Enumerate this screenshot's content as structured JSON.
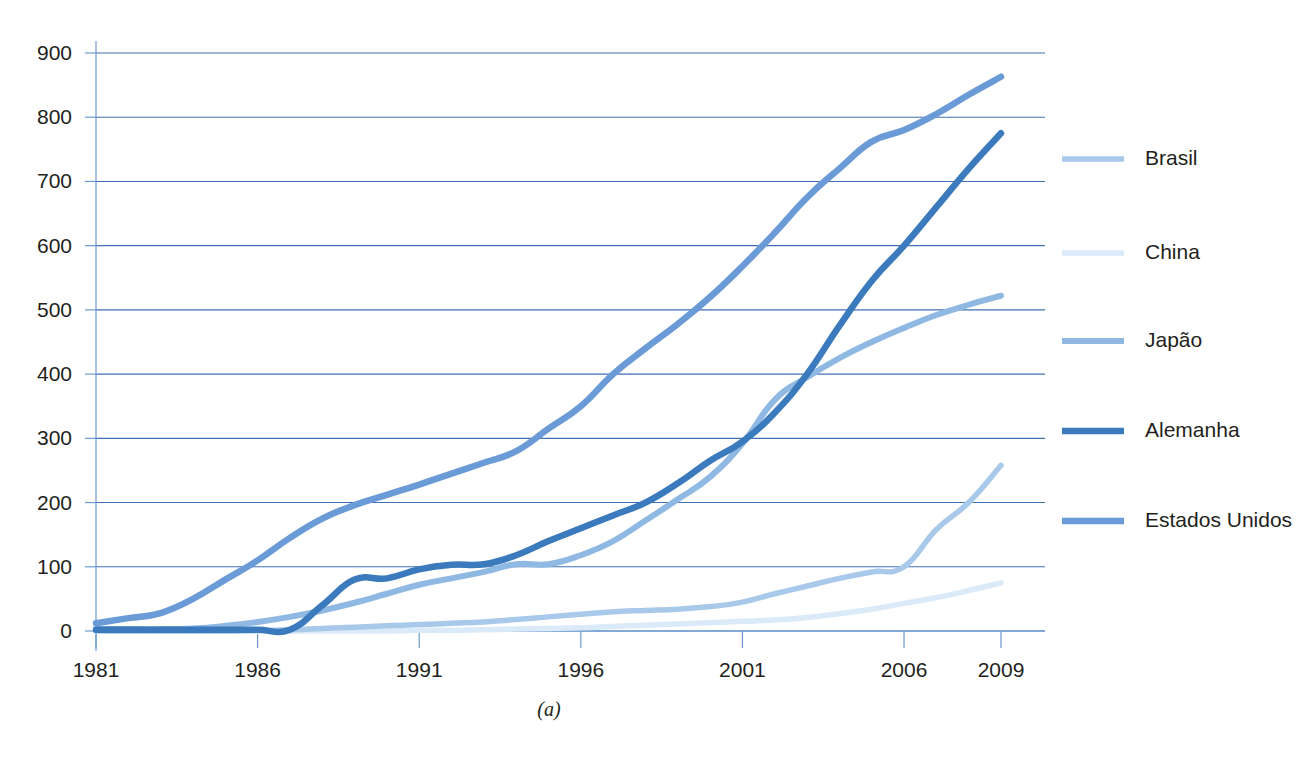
{
  "figure": {
    "caption": "(a)",
    "background": "#ffffff"
  },
  "chart_data": {
    "type": "line",
    "title": "",
    "xlabel": "",
    "ylabel": "",
    "xlim": [
      1981,
      2009
    ],
    "ylim": [
      0,
      900
    ],
    "grid": true,
    "grid_axis": "y",
    "legend_position": "right",
    "x_tick_labels": [
      "1981",
      "1986",
      "1991",
      "1996",
      "2001",
      "2006",
      "2009"
    ],
    "x_ticks": [
      1981,
      1986,
      1991,
      1996,
      2001,
      2006,
      2009
    ],
    "y_tick_labels": [
      "0",
      "100",
      "200",
      "300",
      "400",
      "500",
      "600",
      "700",
      "800",
      "900"
    ],
    "y_ticks": [
      0,
      100,
      200,
      300,
      400,
      500,
      600,
      700,
      800,
      900
    ],
    "x": [
      1981,
      1982,
      1983,
      1984,
      1985,
      1986,
      1987,
      1988,
      1989,
      1990,
      1991,
      1992,
      1993,
      1994,
      1995,
      1996,
      1997,
      1998,
      1999,
      2000,
      2001,
      2002,
      2003,
      2004,
      2005,
      2006,
      2007,
      2008,
      2009
    ],
    "series": [
      {
        "name": "Brasil",
        "color": "#a9c9ea",
        "width": 5.5,
        "values": [
          0,
          0,
          0,
          0,
          0,
          1,
          2,
          4,
          6,
          8,
          10,
          12,
          14,
          18,
          22,
          26,
          30,
          32,
          34,
          38,
          45,
          58,
          70,
          82,
          92,
          100,
          158,
          200,
          258
        ]
      },
      {
        "name": "China",
        "color": "#dbeaf8",
        "width": 5.5,
        "values": [
          0,
          0,
          0,
          0,
          0,
          0,
          0,
          0,
          0,
          0,
          1,
          1,
          2,
          3,
          4,
          5,
          7,
          9,
          11,
          13,
          15,
          17,
          21,
          27,
          34,
          43,
          52,
          63,
          75
        ]
      },
      {
        "name": "Japão",
        "color": "#8fb8e3",
        "width": 6.0,
        "values": [
          3,
          3,
          3,
          4,
          8,
          14,
          22,
          32,
          44,
          58,
          72,
          82,
          92,
          104,
          104,
          118,
          140,
          172,
          205,
          240,
          292,
          360,
          395,
          425,
          450,
          472,
          492,
          508,
          522
        ]
      },
      {
        "name": "Alemanha",
        "color": "#3a7abd",
        "width": 6.5,
        "values": [
          2,
          2,
          2,
          2,
          2,
          2,
          2,
          40,
          80,
          82,
          96,
          103,
          104,
          118,
          140,
          160,
          180,
          200,
          230,
          265,
          295,
          340,
          400,
          475,
          545,
          600,
          660,
          720,
          775
        ]
      },
      {
        "name": "Estados Unidos",
        "color": "#6a9bd6",
        "width": 6.5,
        "values": [
          12,
          20,
          28,
          50,
          80,
          110,
          145,
          175,
          196,
          212,
          228,
          245,
          262,
          280,
          315,
          350,
          400,
          440,
          478,
          520,
          568,
          620,
          675,
          720,
          762,
          780,
          805,
          835,
          863
        ]
      }
    ]
  },
  "legend": {
    "items": [
      {
        "label": "Brasil",
        "color": "#a9c9ea",
        "width": 5.5
      },
      {
        "label": "China",
        "color": "#dbeaf8",
        "width": 5.5
      },
      {
        "label": "Japão",
        "color": "#8fb8e3",
        "width": 6.0
      },
      {
        "label": "Alemanha",
        "color": "#3a7abd",
        "width": 6.5
      },
      {
        "label": "Estados Unidos",
        "color": "#6a9bd6",
        "width": 6.5
      }
    ]
  },
  "axes": {
    "grid_color": "#3f6fb5",
    "axis_color": "#6b9bd2",
    "label_color": "#231f20"
  }
}
